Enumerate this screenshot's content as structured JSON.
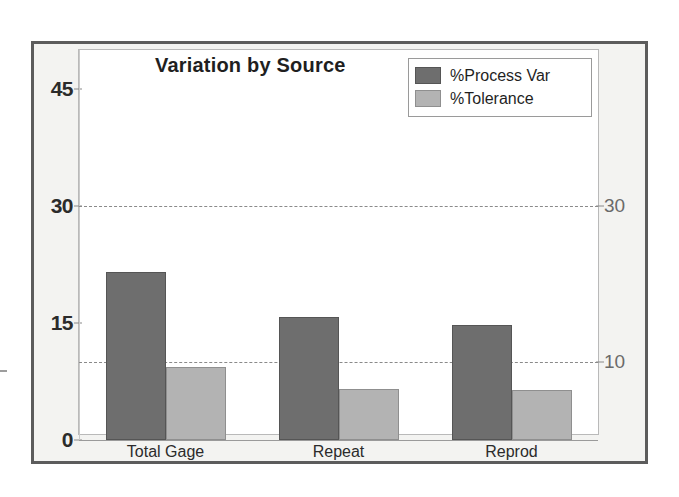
{
  "chart_data": {
    "type": "bar",
    "title": "Variation by Source",
    "xlabel": "",
    "ylabel": "",
    "categories": [
      "Total Gage",
      "Repeat",
      "Reprod"
    ],
    "series": [
      {
        "name": "%Process Var",
        "values": [
          21.5,
          15.8,
          14.7
        ],
        "color": "#6e6e6e"
      },
      {
        "name": "%Tolerance",
        "values": [
          9.4,
          6.5,
          6.4
        ],
        "color": "#b3b3b3"
      }
    ],
    "yaxis_left": {
      "ticks": [
        "0",
        "15",
        "30",
        "45"
      ],
      "tick_values": [
        0,
        15,
        30,
        45
      ],
      "ylim": [
        0,
        50
      ]
    },
    "yaxis_right": {
      "ticks": [
        "10",
        "30"
      ],
      "tick_values": [
        10,
        30
      ]
    },
    "reference_lines": [
      {
        "value": 10,
        "label": "10",
        "style": "dashed"
      },
      {
        "value": 30,
        "label": "30",
        "style": "dashed"
      }
    ],
    "legend": {
      "position": "top-right",
      "entries": [
        "%Process Var",
        "%Tolerance"
      ]
    },
    "grid": false
  },
  "colors": {
    "process_var": "#6e6e6e",
    "tolerance": "#b3b3b3",
    "frame": "#5c5c5c",
    "panel_background": "#f3f3f1",
    "plot_background": "#ffffff",
    "gridline": "#8a8a8a"
  }
}
